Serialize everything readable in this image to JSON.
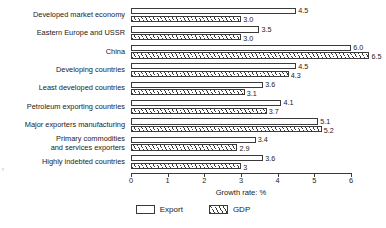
{
  "chart_data": {
    "type": "bar",
    "orientation": "horizontal",
    "title": "",
    "xlabel": "Growth rate: %",
    "ylabel": "",
    "xlim": [
      0,
      6
    ],
    "xticks": [
      0,
      1,
      2,
      3,
      4,
      5,
      6
    ],
    "xtick_labels": [
      "0",
      "1",
      "2",
      "3",
      "4",
      "5",
      "6"
    ],
    "grid": false,
    "legend_position": "bottom-center",
    "categories": [
      "Developed market economy",
      "Eastern Europe and USSR",
      "China",
      "Developing countries",
      "Least developed countries",
      "Petroleum exporting countries",
      "Major exporters manufacturing",
      "Primary commodities and services exporters",
      "Highly indebted countries"
    ],
    "series": [
      {
        "name": "Export",
        "values": [
          4.5,
          3.5,
          6.0,
          4.5,
          3.6,
          4.1,
          5.1,
          3.4,
          3.6
        ],
        "labels": [
          "4.5",
          "3.5",
          "6.0",
          "4.5",
          "3.6",
          "4.1",
          "5.1",
          "3.4",
          "3.6"
        ],
        "fill": "white",
        "pattern": "none"
      },
      {
        "name": "GDP",
        "values": [
          3.0,
          3.0,
          6.5,
          4.3,
          3.1,
          3.7,
          5.2,
          2.9,
          3.0
        ],
        "labels": [
          "3.0",
          "3.0",
          "6.5",
          "4.3",
          "3.1",
          "3.7",
          "5.2",
          "2.9",
          "3"
        ],
        "fill": "white",
        "pattern": "diagonal-hatch"
      }
    ]
  },
  "legend": {
    "items": [
      {
        "label": "Export",
        "pattern": "none"
      },
      {
        "label": "GDP",
        "pattern": "diagonal-hatch"
      }
    ]
  },
  "colors": {
    "line": "#3a3a3a",
    "text": "#1a1a1a",
    "background": "#ffffff"
  },
  "artifact": {
    "mark": "r"
  }
}
